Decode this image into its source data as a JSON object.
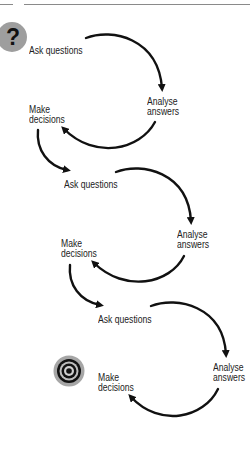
{
  "diagram": {
    "type": "iterative-cycle",
    "colors": {
      "arrow": "#111111",
      "text": "#222222",
      "icon_bg": "#9e9e9e",
      "rule": "#8a8a8a"
    },
    "start_icon": "question-mark-icon",
    "end_icon": "target-icon",
    "cycles": [
      {
        "ask": "Ask questions",
        "analyse_line1": "Analyse",
        "analyse_line2": "answers",
        "decide_line1": "Make",
        "decide_line2": "decisions"
      },
      {
        "ask": "Ask questions",
        "analyse_line1": "Analyse",
        "analyse_line2": "answers",
        "decide_line1": "Make",
        "decide_line2": "decisions"
      },
      {
        "ask": "Ask questions",
        "analyse_line1": "Analyse",
        "analyse_line2": "answers",
        "decide_line1": "Make",
        "decide_line2": "decisions"
      }
    ],
    "question_glyph": "?"
  }
}
